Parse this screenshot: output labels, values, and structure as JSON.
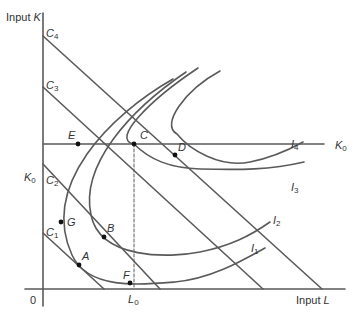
{
  "axes": {
    "y_label_prefix": "Input ",
    "y_label_var": "K",
    "x_label_prefix": "Input ",
    "x_label_var": "L",
    "origin": "0",
    "k0_left": "K",
    "k0_left_sub": "0",
    "k0_right": "K",
    "k0_right_sub": "0",
    "l0": "L",
    "l0_sub": "0"
  },
  "isocost_lines": [
    {
      "name": "C",
      "sub": "1"
    },
    {
      "name": "C",
      "sub": "2"
    },
    {
      "name": "C",
      "sub": "3"
    },
    {
      "name": "C",
      "sub": "4"
    }
  ],
  "isoquants": [
    {
      "name": "I",
      "sub": "1"
    },
    {
      "name": "I",
      "sub": "2"
    },
    {
      "name": "I",
      "sub": "3"
    },
    {
      "name": "I",
      "sub": "4"
    }
  ],
  "points": {
    "A": "A",
    "B": "B",
    "C": "C",
    "D": "D",
    "E": "E",
    "F": "F",
    "G": "G"
  },
  "colors": {
    "curve": "#5a5a5a",
    "point": "#111111",
    "text": "#333333"
  }
}
